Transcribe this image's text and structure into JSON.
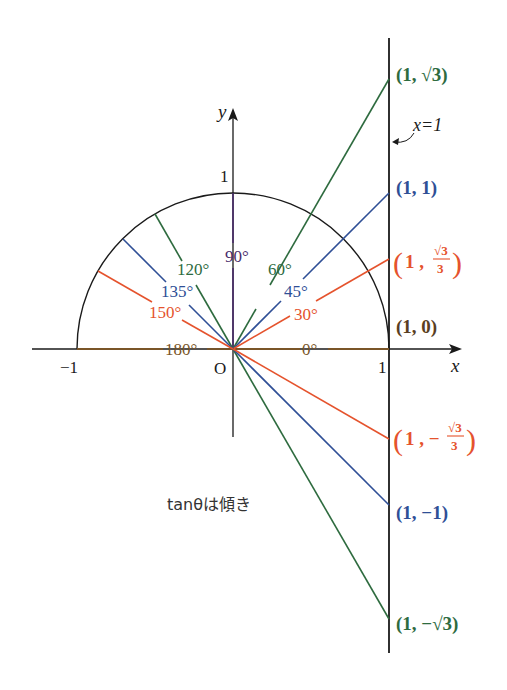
{
  "diagram": {
    "origin_px": [
      233,
      349
    ],
    "unit_px": 156,
    "colors": {
      "green": "#2e6b3f",
      "blue": "#2f4f96",
      "orange": "#e5532d",
      "purple": "#4a2d6b",
      "brown": "#7a5528",
      "black": "#1a1a1a"
    },
    "axes": {
      "x_label": "x",
      "y_label": "y",
      "origin_label": "O",
      "tick_x_neg1": "−1",
      "tick_x_1": "1",
      "tick_y_1": "1"
    },
    "line_x1": {
      "label": "x=1"
    },
    "angles": [
      {
        "deg": 0,
        "label": "0°",
        "color": "brown"
      },
      {
        "deg": 30,
        "label": "30°",
        "color": "orange"
      },
      {
        "deg": 45,
        "label": "45°",
        "color": "blue"
      },
      {
        "deg": 60,
        "label": "60°",
        "color": "green"
      },
      {
        "deg": 90,
        "label": "90°",
        "color": "purple"
      },
      {
        "deg": 120,
        "label": "120°",
        "color": "green"
      },
      {
        "deg": 135,
        "label": "135°",
        "color": "blue"
      },
      {
        "deg": 150,
        "label": "150°",
        "color": "orange"
      },
      {
        "deg": 180,
        "label": "180°",
        "color": "brown"
      }
    ],
    "points": [
      {
        "name": "p-sqrt3",
        "label": "(1, √3)",
        "tan": "√3",
        "color": "green"
      },
      {
        "name": "p-1",
        "label": "(1, 1)",
        "tan": "1",
        "color": "blue"
      },
      {
        "name": "p-sqrt3-over-3",
        "label_pre": "1 , ",
        "frac_num": "√3",
        "frac_den": "3",
        "color": "orange"
      },
      {
        "name": "p-0",
        "label": "(1, 0)",
        "tan": "0",
        "color": "brown"
      },
      {
        "name": "p-neg-sqrt3-over-3",
        "label_pre": "1 , −",
        "frac_num": "√3",
        "frac_den": "3",
        "color": "orange"
      },
      {
        "name": "p-neg1",
        "label": "(1, −1)",
        "tan": "−1",
        "color": "blue"
      },
      {
        "name": "p-neg-sqrt3",
        "label": "(1, −√3)",
        "tan": "−√3",
        "color": "green"
      }
    ],
    "caption": "tanθは傾き"
  }
}
